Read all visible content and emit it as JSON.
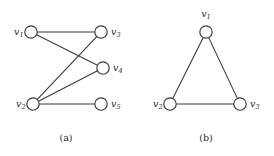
{
  "figure": {
    "width": 274,
    "height": 156,
    "background_color": "#ffffff",
    "stroke_color": "#3a3a3a",
    "text_color": "#2b2b2b",
    "node_fill": "#ffffff"
  },
  "graphs": [
    {
      "id": "graph-a",
      "caption": "(a)",
      "caption_x": 66,
      "caption_y": 141,
      "nodes": [
        {
          "id": "v1",
          "label": "v",
          "sub": "1",
          "cx": 31,
          "cy": 32,
          "r": 6.2,
          "label_x": 14,
          "label_y": 35,
          "label_anchor": "start"
        },
        {
          "id": "v2",
          "label": "v",
          "sub": "2",
          "cx": 33,
          "cy": 104,
          "r": 6.2,
          "label_x": 16,
          "label_y": 107,
          "label_anchor": "start"
        },
        {
          "id": "v3",
          "label": "v",
          "sub": "3",
          "cx": 101,
          "cy": 32,
          "r": 6.2,
          "label_x": 111,
          "label_y": 35,
          "label_anchor": "start"
        },
        {
          "id": "v4",
          "label": "v",
          "sub": "4",
          "cx": 103,
          "cy": 68,
          "r": 6.2,
          "label_x": 113,
          "label_y": 71,
          "label_anchor": "start"
        },
        {
          "id": "v5",
          "label": "v",
          "sub": "5",
          "cx": 101,
          "cy": 104,
          "r": 6.2,
          "label_x": 111,
          "label_y": 107,
          "label_anchor": "start"
        }
      ],
      "edges": [
        {
          "from": "v1",
          "to": "v3"
        },
        {
          "from": "v1",
          "to": "v4"
        },
        {
          "from": "v2",
          "to": "v3"
        },
        {
          "from": "v2",
          "to": "v4"
        },
        {
          "from": "v2",
          "to": "v5"
        }
      ]
    },
    {
      "id": "graph-b",
      "caption": "(b)",
      "caption_x": 206,
      "caption_y": 141,
      "nodes": [
        {
          "id": "v1",
          "label": "v",
          "sub": "1",
          "cx": 206,
          "cy": 32,
          "r": 6.2,
          "label_x": 206,
          "label_y": 17,
          "label_anchor": "middle"
        },
        {
          "id": "v2",
          "label": "v",
          "sub": "2",
          "cx": 170,
          "cy": 104,
          "r": 6.2,
          "label_x": 153,
          "label_y": 107,
          "label_anchor": "start"
        },
        {
          "id": "v3",
          "label": "v",
          "sub": "3",
          "cx": 240,
          "cy": 104,
          "r": 6.2,
          "label_x": 250,
          "label_y": 107,
          "label_anchor": "start"
        }
      ],
      "edges": [
        {
          "from": "v1",
          "to": "v2"
        },
        {
          "from": "v1",
          "to": "v3"
        },
        {
          "from": "v2",
          "to": "v3"
        }
      ]
    }
  ]
}
